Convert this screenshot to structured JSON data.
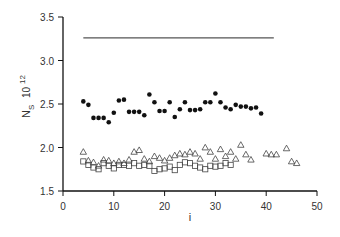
{
  "chart_data": {
    "type": "scatter",
    "title": "",
    "xlabel": "i",
    "ylabel": "N_S 10^12",
    "ylabel_main": "N",
    "ylabel_sub": "S",
    "ylabel_mult": "10",
    "ylabel_exp": "12",
    "xlim": [
      0,
      50
    ],
    "ylim": [
      1.5,
      3.5
    ],
    "xticks": [
      0,
      10,
      20,
      30,
      40,
      50
    ],
    "xtick_labels": [
      "0",
      "10",
      "20",
      "30",
      "40",
      "50"
    ],
    "yticks": [
      1.5,
      2.0,
      2.5,
      3.0,
      3.5
    ],
    "ytick_labels": [
      "1.5",
      "2.0",
      "2.5",
      "3.0",
      "3.5"
    ],
    "grid": false,
    "legend": null,
    "series": [
      {
        "name": "reference line",
        "marker": "line",
        "x": [
          4,
          41.5
        ],
        "y": [
          3.26,
          3.26
        ]
      },
      {
        "name": "filled circles",
        "marker": "filled-circle",
        "x": [
          4,
          5,
          6,
          7,
          8,
          9,
          10,
          11,
          12,
          13,
          14,
          15,
          16,
          17,
          18,
          19,
          20,
          21,
          22,
          23,
          24,
          25,
          26,
          27,
          28,
          29,
          30,
          31,
          32,
          33,
          34,
          35,
          36,
          37,
          38,
          39
        ],
        "y": [
          2.53,
          2.49,
          2.34,
          2.34,
          2.34,
          2.29,
          2.4,
          2.54,
          2.55,
          2.41,
          2.41,
          2.41,
          2.37,
          2.61,
          2.52,
          2.42,
          2.42,
          2.52,
          2.35,
          2.44,
          2.52,
          2.43,
          2.43,
          2.44,
          2.52,
          2.52,
          2.62,
          2.52,
          2.46,
          2.44,
          2.49,
          2.47,
          2.47,
          2.45,
          2.46,
          2.39
        ]
      },
      {
        "name": "open triangles",
        "marker": "open-triangle",
        "x": [
          4,
          5,
          6,
          7,
          8,
          9,
          10,
          11,
          12,
          13,
          14,
          15,
          16,
          17,
          18,
          19,
          20,
          21,
          22,
          23,
          24,
          25,
          26,
          27,
          28,
          29,
          30,
          31,
          32,
          33,
          34,
          35,
          36,
          37,
          40,
          41,
          42,
          44,
          45,
          46
        ],
        "y": [
          1.95,
          1.85,
          1.83,
          1.79,
          1.86,
          1.85,
          1.82,
          1.84,
          1.82,
          1.86,
          1.95,
          1.97,
          1.87,
          1.84,
          1.9,
          1.88,
          1.85,
          1.88,
          1.91,
          1.93,
          1.92,
          1.95,
          1.93,
          1.87,
          2.0,
          1.95,
          1.87,
          1.98,
          1.9,
          1.95,
          1.87,
          2.03,
          1.92,
          1.86,
          1.93,
          1.92,
          1.92,
          1.99,
          1.84,
          1.82
        ]
      },
      {
        "name": "open squares",
        "marker": "open-square",
        "x": [
          4,
          5,
          6,
          7,
          8,
          9,
          10,
          11,
          12,
          13,
          14,
          15,
          16,
          17,
          18,
          19,
          20,
          21,
          22,
          23,
          24,
          25,
          26,
          27,
          28,
          29,
          30,
          31,
          32,
          33
        ],
        "y": [
          1.84,
          1.8,
          1.77,
          1.75,
          1.82,
          1.79,
          1.76,
          1.8,
          1.8,
          1.79,
          1.82,
          1.79,
          1.8,
          1.79,
          1.73,
          1.75,
          1.76,
          1.78,
          1.74,
          1.8,
          1.83,
          1.82,
          1.79,
          1.77,
          1.75,
          1.79,
          1.78,
          1.79,
          1.82,
          1.8
        ]
      }
    ]
  },
  "layout": {
    "plot_left": 63,
    "plot_right": 317,
    "plot_top": 17,
    "plot_bottom": 191,
    "color": "#111111"
  }
}
